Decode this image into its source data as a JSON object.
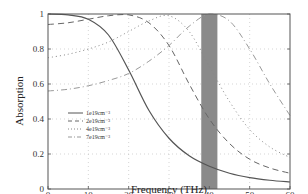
{
  "chart_data": {
    "type": "line",
    "title": "",
    "xlabel": "Frequency (THz)",
    "ylabel": "Absorption",
    "xlim": [
      0,
      60
    ],
    "ylim": [
      0,
      1
    ],
    "xticks": [
      0,
      10,
      20,
      30,
      40,
      50,
      60
    ],
    "yticks": [
      0,
      0.2,
      0.4,
      0.6,
      0.8,
      1
    ],
    "xtick_labels": [
      "0",
      "10",
      "20",
      "30",
      "40",
      "50",
      "60"
    ],
    "ytick_labels": [
      "0",
      "0.2",
      "0.4",
      "0.6",
      "0.8",
      "1"
    ],
    "grid": true,
    "legend_position": "lower left",
    "shaded_band": {
      "x_start": 38,
      "x_end": 42,
      "color": "#8a8a8a"
    },
    "x": [
      0,
      5,
      10,
      15,
      20,
      25,
      30,
      35,
      40,
      45,
      50,
      55,
      60
    ],
    "series": [
      {
        "name": "1e19cm⁻³",
        "style": "solid",
        "color": "#555555",
        "values": [
          1.0,
          0.995,
          0.97,
          0.88,
          0.68,
          0.45,
          0.29,
          0.19,
          0.13,
          0.09,
          0.065,
          0.05,
          0.04
        ]
      },
      {
        "name": "2e19cm⁻³",
        "style": "dashed",
        "color": "#666666",
        "values": [
          0.94,
          0.95,
          0.97,
          0.99,
          0.995,
          0.95,
          0.82,
          0.6,
          0.4,
          0.26,
          0.17,
          0.12,
          0.09
        ]
      },
      {
        "name": "4e19cm⁻³",
        "style": "dotted",
        "color": "#888888",
        "values": [
          0.75,
          0.77,
          0.8,
          0.84,
          0.9,
          0.96,
          0.99,
          0.9,
          0.7,
          0.5,
          0.34,
          0.24,
          0.18
        ]
      },
      {
        "name": "7e19cm⁻³",
        "style": "dashdot",
        "color": "#999999",
        "values": [
          0.56,
          0.57,
          0.59,
          0.62,
          0.66,
          0.73,
          0.82,
          0.93,
          1.0,
          0.96,
          0.8,
          0.6,
          0.42
        ]
      }
    ]
  }
}
